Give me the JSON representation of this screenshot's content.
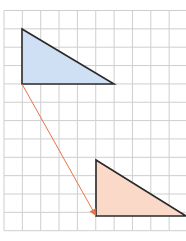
{
  "diagram": {
    "type": "translation-on-grid",
    "grid": {
      "origin_x": 4,
      "origin_y": 10.5,
      "cell": 18.35,
      "cols": 10,
      "rows": 12,
      "line_color": "#cfcfcf"
    },
    "shapes": [
      {
        "name": "original-triangle",
        "role": "pre-image",
        "fill": "#cfe0f5",
        "stroke": "#2a2a2a",
        "points": [
          [
            22,
            29
          ],
          [
            22,
            84
          ],
          [
            114,
            84
          ]
        ]
      },
      {
        "name": "translated-triangle",
        "role": "image",
        "fill": "#fad9c8",
        "stroke": "#2a2a2a",
        "points": [
          [
            96,
            160
          ],
          [
            96,
            216
          ],
          [
            186,
            216
          ]
        ]
      }
    ],
    "arrow": {
      "name": "translation-vector",
      "color": "#e8734a",
      "from": [
        22,
        84
      ],
      "to": [
        96,
        216
      ]
    }
  }
}
